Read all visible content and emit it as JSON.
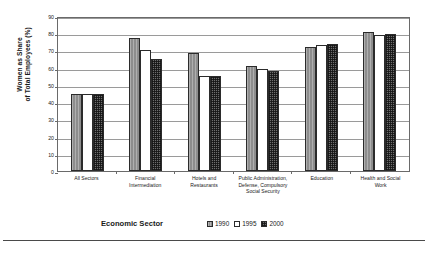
{
  "chart_data": {
    "type": "bar",
    "title": "",
    "xlabel": "Economic Sector",
    "ylabel": "Women as Share\nof Total Employees (%)",
    "ylim": [
      0,
      90
    ],
    "yticks": [
      0,
      10,
      20,
      30,
      40,
      50,
      60,
      70,
      80,
      90
    ],
    "ytick_labels": [
      "0",
      "10",
      "20",
      "30",
      "40",
      "50",
      "60",
      "70",
      "80",
      "90"
    ],
    "grid": true,
    "legend_position": "bottom-right",
    "categories": [
      "All Sectors",
      "Financial\nIntermediation",
      "Hotels and\nRestaurants",
      "Public Administration,\nDefense, Compulsory\nSocial Security",
      "Education",
      "Health and Social\nWork"
    ],
    "series": [
      {
        "name": "1990",
        "values": [
          44.5,
          77.5,
          68.5,
          61.0,
          72.0,
          80.5
        ]
      },
      {
        "name": "1995",
        "values": [
          44.5,
          70.0,
          55.0,
          59.0,
          73.0,
          79.0
        ]
      },
      {
        "name": "2000",
        "values": [
          44.5,
          65.0,
          55.0,
          58.0,
          73.5,
          79.5
        ]
      }
    ],
    "series_styles": [
      "hatched-light-gray",
      "white",
      "checkered-dark-gray"
    ]
  },
  "legend": {
    "items": [
      {
        "label": "1990",
        "style": "y1990"
      },
      {
        "label": "1995",
        "style": "y1995"
      },
      {
        "label": "2000",
        "style": "y2000"
      }
    ]
  }
}
